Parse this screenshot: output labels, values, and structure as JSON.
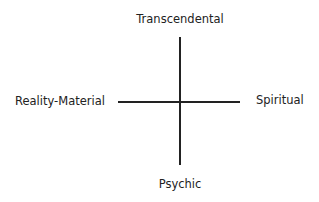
{
  "diagram": {
    "type": "quadrant-axes",
    "labels": {
      "top": "Transcendental",
      "bottom": "Psychic",
      "left": "Reality-Material",
      "right": "Spiritual"
    },
    "colors": {
      "line": "#222222",
      "text": "#222222",
      "background": "#ffffff"
    }
  }
}
